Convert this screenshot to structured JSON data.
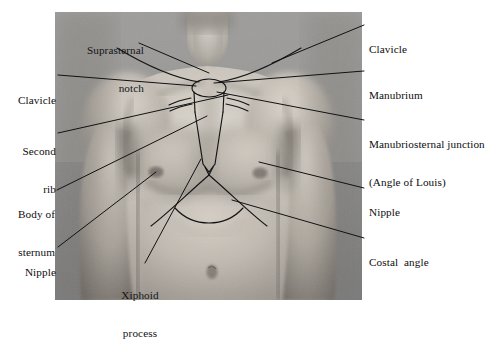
{
  "figure": {
    "type": "anatomical-photograph-diagram",
    "background_color": "#ffffff",
    "photo": {
      "x": 55,
      "y": 12,
      "width": 307,
      "height": 288,
      "style": "black-and-white photograph",
      "description": "Frontal view of a male chest and upper abdomen with the sternum, clavicles, second ribs and costal margin drawn on the skin"
    },
    "line_color": "#111111"
  },
  "labels": [
    {
      "id": "suprasternal-notch",
      "text_lines": [
        "Suprasternal",
        "notch"
      ],
      "align": "right",
      "position": "top-left-inside-photo",
      "x": 60,
      "y": 19,
      "leader_from": [
        139,
        43
      ],
      "leader_to": [
        209,
        73
      ]
    },
    {
      "id": "clavicle-left",
      "text_lines": [
        "Clavicle"
      ],
      "align": "right",
      "position": "left-margin",
      "x": 12,
      "y": 69,
      "leader_from": [
        58,
        75
      ],
      "leader_to": [
        196,
        86
      ]
    },
    {
      "id": "second-rib",
      "text_lines": [
        "Second",
        "rib"
      ],
      "align": "right",
      "position": "left-margin",
      "x": 14,
      "y": 120,
      "leader_from": [
        58,
        133
      ],
      "leader_to": [
        228,
        95
      ]
    },
    {
      "id": "body-of-sternum",
      "text_lines": [
        "Body of",
        "sternum"
      ],
      "align": "right",
      "position": "left-margin",
      "x": 5,
      "y": 183,
      "leader_from": [
        57,
        190
      ],
      "leader_to": [
        206,
        115
      ]
    },
    {
      "id": "nipple-left",
      "text_lines": [
        "Nipple"
      ],
      "align": "right",
      "position": "left-margin",
      "x": 14,
      "y": 243,
      "leader_from": [
        58,
        247
      ],
      "leader_to": [
        155,
        172
      ]
    },
    {
      "id": "xiphoid-process",
      "text_lines": [
        "Xiphoid",
        "process"
      ],
      "align": "center",
      "position": "inside-photo-bottom",
      "x": 101,
      "y": 264,
      "leader_from": [
        144,
        265
      ],
      "leader_to": [
        200,
        160
      ]
    },
    {
      "id": "clavicle-right",
      "text_lines": [
        "Clavicle"
      ],
      "align": "left",
      "position": "right-margin",
      "x": 367,
      "y": 17,
      "leader_from": [
        364,
        25
      ],
      "leader_to": [
        272,
        63
      ]
    },
    {
      "id": "manubrium",
      "text_lines": [
        "Manubrium"
      ],
      "align": "left",
      "position": "right-margin",
      "x": 367,
      "y": 64,
      "leader_from": [
        364,
        71
      ],
      "leader_to": [
        214,
        83
      ]
    },
    {
      "id": "manubriosternal-junction",
      "text_lines": [
        "Manubriosternal junction",
        "(Angle of Louis)"
      ],
      "align": "left",
      "position": "right-margin",
      "x": 367,
      "y": 113,
      "leader_from": [
        364,
        120
      ],
      "leader_to": [
        216,
        92
      ]
    },
    {
      "id": "nipple-right",
      "text_lines": [
        "Nipple"
      ],
      "align": "left",
      "position": "right-margin",
      "x": 367,
      "y": 182,
      "leader_from": [
        364,
        188
      ],
      "leader_to": [
        258,
        162
      ]
    },
    {
      "id": "costal-angle",
      "text_lines": [
        "Costal",
        "angle"
      ],
      "text": "Costal  angle",
      "align": "left",
      "position": "right-margin",
      "x": 367,
      "y": 232,
      "leader_from": [
        364,
        238
      ],
      "leader_to": [
        231,
        200
      ]
    }
  ],
  "label_text": {
    "suprasternal_notch_1": "Suprasternal",
    "suprasternal_notch_2": "notch",
    "clavicle_left": "Clavicle",
    "second_rib_1": "Second",
    "second_rib_2": "rib",
    "body_of_sternum_1": "Body of",
    "body_of_sternum_2": "sternum",
    "nipple_left": "Nipple",
    "xiphoid_process_1": "Xiphoid",
    "xiphoid_process_2": "process",
    "clavicle_right": "Clavicle",
    "manubrium": "Manubrium",
    "manubriosternal_junction_1": "Manubriosternal junction",
    "manubriosternal_junction_2": "(Angle of Louis)",
    "nipple_right": "Nipple",
    "costal_angle": "Costal  angle"
  }
}
